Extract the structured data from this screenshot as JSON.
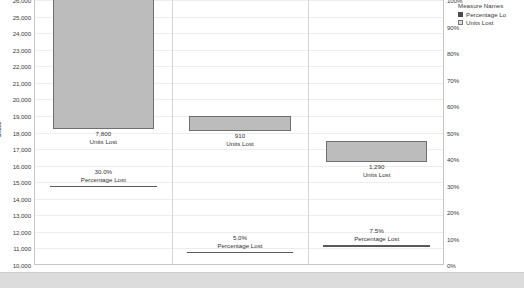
{
  "chart_data": {
    "type": "bar",
    "title": "",
    "subtitle": "",
    "categories": [
      "Utilization",
      "Efficiency",
      "Quality"
    ],
    "xlabel": "",
    "ylabel": "Units",
    "ylabel_right": "",
    "ylim": [
      10000,
      26000
    ],
    "ytick_step": 1000,
    "ylim_right": [
      0,
      100
    ],
    "ytick_step_right": 10,
    "grid": true,
    "legend_position": "top-right",
    "series": [
      {
        "name": "Units Lost",
        "mark": "bar",
        "axis": "left",
        "values": [
          7800,
          910,
          1290
        ],
        "bar_ranges": [
          [
            18200,
            26800
          ],
          [
            18090,
            19000
          ],
          [
            16210,
            17500
          ]
        ],
        "value_labels": [
          "7,800",
          "910",
          "1,290"
        ],
        "label_caption": "Units Lost"
      },
      {
        "name": "Percentage Lost",
        "mark": "reference-line",
        "axis": "right",
        "values": [
          30.0,
          5.0,
          7.5
        ],
        "value_labels": [
          "30.0%",
          "5.0%",
          "7.5%"
        ],
        "label_caption": "Percentage Lost"
      }
    ],
    "ytick_labels_left": [
      "26,000",
      "25,000",
      "24,000",
      "23,000",
      "22,000",
      "21,000",
      "20,000",
      "19,000",
      "18,000",
      "17,000",
      "16,000",
      "15,000",
      "14,000",
      "13,000",
      "12,000",
      "11,000",
      "10,000"
    ],
    "ytick_labels_right": [
      "100%",
      "90%",
      "80%",
      "70%",
      "60%",
      "50%",
      "40%",
      "30%",
      "20%",
      "10%",
      "0%"
    ]
  },
  "legend": {
    "title": "Measure Names",
    "items": [
      {
        "label": "Percentage Lo",
        "swatch": "filled",
        "color": "#4c4c4c"
      },
      {
        "label": "Units Lost",
        "swatch": "outlined",
        "color": "#dedede"
      }
    ]
  },
  "axis": {
    "left_title": "Units"
  },
  "marks": {
    "utilization": {
      "units_value": "7,800",
      "units_caption": "Units Lost",
      "pct_value": "30.0%",
      "pct_caption": "Percentage Lost"
    },
    "efficiency": {
      "units_value": "910",
      "units_caption": "Units Lost",
      "pct_value": "5.0%",
      "pct_caption": "Percentage Lost"
    },
    "quality": {
      "units_value": "1,290",
      "units_caption": "Units Lost",
      "pct_value": "7.5%",
      "pct_caption": "Percentage Lost"
    }
  },
  "footer": {
    "text": ""
  },
  "colors": {
    "bar_fill": "#bcbcbc",
    "bar_border": "#6f6f6f",
    "reference_line": "#5a5a5a",
    "gridline": "#ededed",
    "axis_line": "#c6c6c6",
    "text": "#333333"
  }
}
